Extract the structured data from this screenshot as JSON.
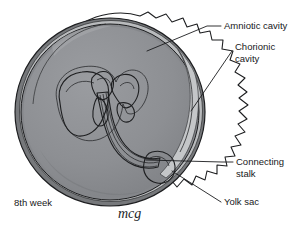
{
  "figure": {
    "title_caption": "8th week",
    "signature": "mcg",
    "canvas": {
      "width": 302,
      "height": 235,
      "background": "#ffffff"
    }
  },
  "labels": [
    {
      "id": "amniotic-cavity",
      "text": "Amniotic cavity",
      "text_x": 224,
      "text_y": 29,
      "leader": "M 221 26 L 207 26 L 147 51"
    },
    {
      "id": "chorionic-cavity",
      "text_line1": "Chorionic",
      "text_line2": "cavity",
      "text_x": 235,
      "text_y": 50,
      "text_y2": 62,
      "leader": "M 232 51 L 191 111"
    },
    {
      "id": "connecting-stalk",
      "text_line1": "Connecting",
      "text_line2": "stalk",
      "text_x": 236,
      "text_y": 165,
      "text_y2": 177,
      "leader": "M 233 162 L 222 162 L 146 160"
    },
    {
      "id": "yolk-sac",
      "text": "Yolk sac",
      "text_x": 224,
      "text_y": 205,
      "leader": "M 221 202 L 172 171"
    }
  ],
  "colors": {
    "chorion_villi": "#6f7073",
    "chorion_villi_edge": "#5c5d60",
    "amniotic_cavity": "#8e9094",
    "amnion_rim": "#9a9ca0",
    "chorionic_cavity_gap": "#c9cbcd",
    "embryo_body": "#eceeef",
    "embryo_shade": "#d6d8da",
    "yolk_sac": "#dcdee0",
    "stalk": "#e2e4e6",
    "outline": "#1d1e20",
    "label_text": "#17181a",
    "background": "#ffffff"
  },
  "structures": [
    {
      "id": "chorion-villi-mass",
      "name": "Chorion with villi (outer scalloped mass)"
    },
    {
      "id": "amniotic-sac",
      "name": "Amniotic cavity (large sphere)"
    },
    {
      "id": "chorionic-cavity-crescent",
      "name": "Chorionic cavity (light crescent gap)"
    },
    {
      "id": "embryo",
      "name": "Embryo at 8 weeks"
    },
    {
      "id": "connecting-stalk-body",
      "name": "Connecting stalk / umbilical cord"
    },
    {
      "id": "yolk-sac-body",
      "name": "Yolk sac"
    }
  ]
}
